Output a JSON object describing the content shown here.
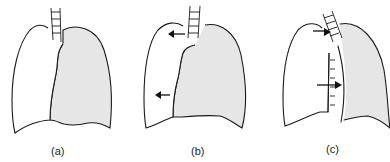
{
  "figure": {
    "panels": [
      {
        "id": "a",
        "label": "(a)",
        "description": "Normal lungs: left lung clear, right lung shaded, trachea midline"
      },
      {
        "id": "b",
        "label": "(b)",
        "description": "Left lung outline expanded outward with arrows pointing left"
      },
      {
        "id": "c",
        "label": "(c)",
        "description": "Trachea and mediastinum shifted with arrows pointing right"
      }
    ],
    "colors": {
      "stroke": "#1a1a1a",
      "lung_shade": "#e6e6e6",
      "background": "#ffffff"
    },
    "icons": {
      "arrow_left": "arrow-left-icon",
      "arrow_right": "arrow-right-icon"
    }
  }
}
